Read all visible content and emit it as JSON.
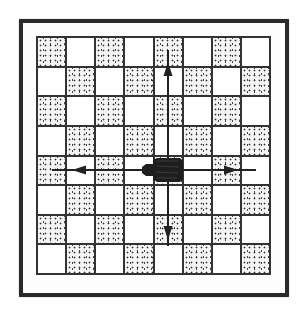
{
  "diagram": {
    "title": "",
    "board": {
      "rows": 8,
      "cols": 8,
      "top_left_color": "dark",
      "dark_pattern": "stipple-dots",
      "line_color": "#333333"
    },
    "piece": {
      "type": "rook",
      "color": "#1e1e1e",
      "row": 5,
      "col": 5
    },
    "arrows": [
      {
        "direction": "up",
        "from_row": 5,
        "to_row": 1,
        "col": 5
      },
      {
        "direction": "down",
        "from_row": 5,
        "to_row": 8,
        "col": 5
      },
      {
        "direction": "left",
        "from_col": 5,
        "to_col": 1,
        "row": 5
      },
      {
        "direction": "right",
        "from_col": 5,
        "to_col": 8,
        "row": 5
      }
    ],
    "colors": {
      "frame": "#2a2a2a",
      "arrow": "#222222",
      "background": "#ffffff"
    }
  }
}
